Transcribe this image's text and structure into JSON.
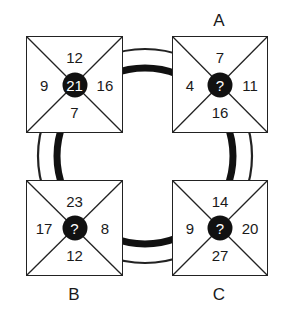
{
  "puzzle": {
    "ring": {
      "outer_stroke": "#222222",
      "inner_stroke": "#111111"
    },
    "boxes": [
      {
        "id": "top-left",
        "label": "",
        "top": "12",
        "left": "9",
        "right": "16",
        "bottom": "7",
        "center": "21"
      },
      {
        "id": "A",
        "label": "A",
        "top": "7",
        "left": "4",
        "right": "11",
        "bottom": "16",
        "center": "?"
      },
      {
        "id": "B",
        "label": "B",
        "top": "23",
        "left": "17",
        "right": "8",
        "bottom": "12",
        "center": "?"
      },
      {
        "id": "C",
        "label": "C",
        "top": "14",
        "left": "9",
        "right": "20",
        "bottom": "27",
        "center": "?"
      }
    ]
  }
}
